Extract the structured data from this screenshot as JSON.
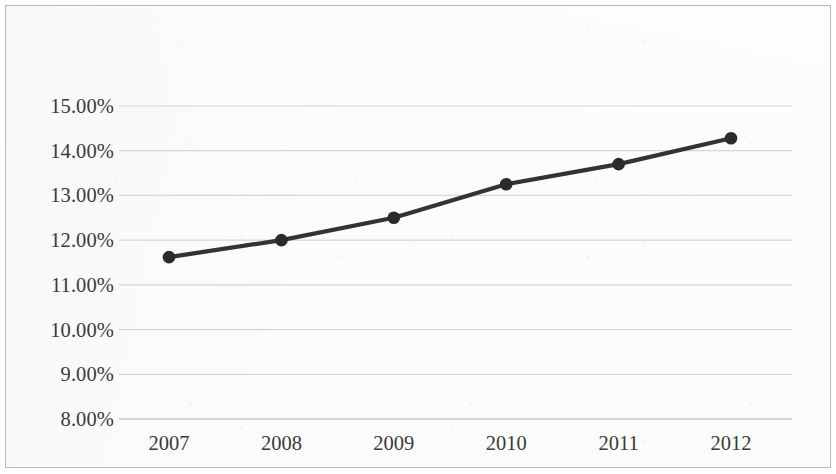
{
  "chart_data": {
    "type": "line",
    "title": "",
    "subtitle": "",
    "xlabel": "",
    "ylabel": "",
    "categories": [
      "2007",
      "2008",
      "2009",
      "2010",
      "2011",
      "2012"
    ],
    "series": [
      {
        "name": "",
        "values": [
          11.62,
          12.0,
          12.5,
          13.25,
          13.7,
          14.28
        ]
      }
    ],
    "ylim": [
      8.0,
      15.0
    ],
    "ytick_step": 1.0,
    "ytick_labels": [
      "15.00%",
      "14.00%",
      "13.00%",
      "12.00%",
      "11.00%",
      "10.00%",
      "9.00%",
      "8.00%"
    ],
    "ytick_values": [
      15.0,
      14.0,
      13.0,
      12.0,
      11.0,
      10.0,
      9.0,
      8.0
    ],
    "xtick_labels": [
      "2007",
      "2008",
      "2009",
      "2010",
      "2011",
      "2012"
    ],
    "grid": true,
    "grid_axis": "y",
    "legend": false,
    "legend_position": "none",
    "marker": "circle",
    "colors": {
      "line": "#333333",
      "marker": "#2b2b2b",
      "gridline": "#d6d6d6",
      "axis": "#c9c9c9",
      "border": "#b8b8b8",
      "background": "#fdfdfc",
      "text": "#3a3a3a"
    }
  }
}
